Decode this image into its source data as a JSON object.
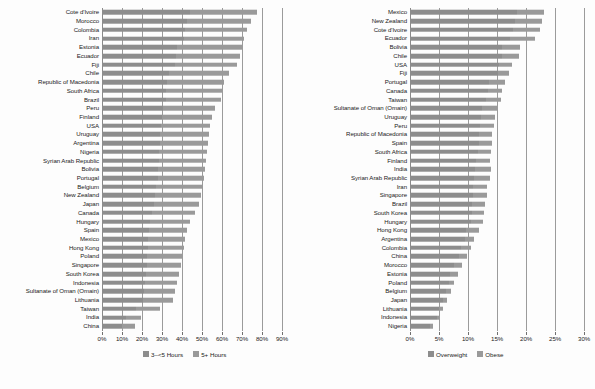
{
  "chart_data": [
    {
      "id": "sitting-hours",
      "type": "bar",
      "orientation": "horizontal",
      "stacked": true,
      "title": "",
      "xlabel": "",
      "ylabel": "",
      "xlim": [
        0,
        95
      ],
      "xticks": [
        0,
        10,
        20,
        30,
        40,
        50,
        60,
        70,
        80,
        90
      ],
      "xticklabels": [
        "0%",
        "10%",
        "20%",
        "30%",
        "40%",
        "50%",
        "60%",
        "70%",
        "80%",
        "90%"
      ],
      "grid": true,
      "legend_position": "bottom",
      "legend": [
        "3–<5 Hours",
        "5+ Hours"
      ],
      "series": [
        {
          "name": "3–<5 Hours",
          "color": "#8d8d8d",
          "values": [
            44.0,
            42.5,
            41.5,
            41.0,
            37.5,
            37.0,
            36.5,
            33.5,
            32.5,
            32.0,
            32.0,
            30.5,
            30.0,
            29.5,
            29.0,
            29.0,
            28.5,
            28.5,
            28.0,
            28.0,
            27.0,
            26.5,
            26.0,
            25.0,
            24.0,
            23.5,
            23.0,
            23.0,
            22.5,
            22.5,
            22.0,
            21.5,
            21.0,
            20.5,
            17.0,
            12.0,
            10.0
          ]
        },
        {
          "name": "5+ Hours",
          "color": "#9a9a9a",
          "values": [
            33.5,
            32.0,
            31.0,
            30.0,
            32.5,
            32.0,
            31.0,
            30.0,
            28.5,
            28.0,
            27.5,
            26.0,
            25.0,
            24.5,
            24.5,
            24.0,
            24.0,
            23.5,
            23.5,
            23.0,
            23.5,
            23.0,
            22.5,
            21.5,
            20.0,
            19.0,
            18.5,
            18.0,
            17.5,
            17.0,
            16.5,
            16.0,
            15.5,
            15.0,
            12.0,
            7.5,
            6.5
          ]
        }
      ],
      "categories": [
        "Cote d'Ivoire",
        "Morocco",
        "Colombia",
        "Iran",
        "Estonia",
        "Ecuador",
        "Fiji",
        "Chile",
        "Republic of Macedonia",
        "South Africa",
        "Brazil",
        "Peru",
        "Finland",
        "USA",
        "Uruguay",
        "Argentina",
        "Nigeria",
        "Syrian Arab Republic",
        "Bolivia",
        "Portugal",
        "Belgium",
        "New Zealand",
        "Japan",
        "Canada",
        "Hungary",
        "Spain",
        "Mexico",
        "Hong Kong",
        "Poland",
        "Singapore",
        "South Korea",
        "Indonesia",
        "Sultanate of Oman (Omain)",
        "Lithuania",
        "Taiwan",
        "India",
        "China"
      ],
      "totals": [
        77.5,
        74.5,
        72.5,
        71.0,
        70.0,
        69.0,
        67.5,
        63.5,
        61.0,
        60.0,
        59.5,
        56.5,
        55.0,
        54.0,
        53.5,
        53.0,
        52.5,
        52.0,
        51.5,
        51.0,
        50.5,
        49.5,
        48.5,
        46.5,
        44.0,
        42.5,
        41.5,
        41.0,
        40.0,
        39.5,
        38.5,
        37.5,
        36.5,
        35.5,
        29.0,
        19.5,
        16.5
      ]
    },
    {
      "id": "overweight-obese",
      "type": "bar",
      "orientation": "horizontal",
      "stacked": true,
      "title": "",
      "xlabel": "",
      "ylabel": "",
      "xlim": [
        0,
        31
      ],
      "xticks": [
        0,
        5,
        10,
        15,
        20,
        25,
        30
      ],
      "xticklabels": [
        "0%",
        "5%",
        "10%",
        "15%",
        "20%",
        "25%",
        "30%"
      ],
      "grid": true,
      "legend_position": "bottom",
      "legend": [
        "Overweight",
        "Obese"
      ],
      "series": [
        {
          "name": "Overweight",
          "color": "#8d8d8d",
          "values": [
            18.5,
            18.0,
            17.8,
            17.3,
            15.8,
            15.8,
            15.3,
            15.1,
            13.6,
            13.4,
            13.1,
            12.4,
            12.2,
            12.0,
            11.9,
            11.8,
            11.7,
            11.3,
            11.2,
            11.1,
            10.9,
            10.8,
            10.7,
            10.6,
            10.5,
            9.6,
            9.4,
            8.7,
            8.4,
            7.5,
            6.9,
            6.7,
            6.2,
            5.6,
            5.0,
            4.6,
            3.5
          ]
        },
        {
          "name": "Obese",
          "color": "#9a9a9a",
          "values": [
            4.5,
            4.7,
            4.6,
            4.3,
            3.1,
            3.0,
            2.2,
            2.0,
            2.8,
            2.4,
            2.5,
            2.5,
            2.4,
            2.4,
            2.3,
            2.3,
            2.2,
            2.5,
            2.7,
            2.6,
            2.3,
            2.4,
            2.2,
            2.2,
            2.1,
            2.2,
            1.7,
            1.8,
            1.5,
            1.4,
            1.3,
            0.9,
            0.8,
            0.7,
            0.6,
            0.6,
            0.5
          ]
        }
      ],
      "categories": [
        "Mexico",
        "New Zealand",
        "Cote d'Ivoire",
        "Ecuador",
        "Bolivia",
        "Chile",
        "USA",
        "Fiji",
        "Portugal",
        "Canada",
        "Taiwan",
        "Sultanate of Oman (Omain)",
        "Uruguay",
        "Peru",
        "Republic of Macedonia",
        "Spain",
        "South Africa",
        "Finland",
        "India",
        "Syrian Arab Republic",
        "Iran",
        "Singapore",
        "Brazil",
        "South Korea",
        "Hungary",
        "Hong Kong",
        "Argentina",
        "Colombia",
        "China",
        "Morocco",
        "Estonia",
        "Poland",
        "Belgium",
        "Japan",
        "Lithuania",
        "Indonesia",
        "Nigeria"
      ],
      "totals": [
        23.0,
        22.7,
        22.4,
        21.6,
        18.9,
        18.8,
        17.5,
        17.1,
        16.4,
        15.8,
        15.6,
        14.9,
        14.6,
        14.4,
        14.2,
        14.1,
        13.9,
        13.8,
        13.9,
        13.8,
        13.2,
        13.2,
        12.9,
        12.8,
        12.6,
        11.8,
        11.1,
        10.5,
        9.9,
        8.9,
        8.2,
        7.6,
        7.0,
        6.3,
        5.6,
        5.2,
        4.0
      ]
    }
  ],
  "colors": {
    "series_a": "#8d8d8d",
    "series_b": "#9a9a9a",
    "gridline": "#9b9b9b",
    "text": "#1a1a1a",
    "background": "#fdfdfd"
  }
}
